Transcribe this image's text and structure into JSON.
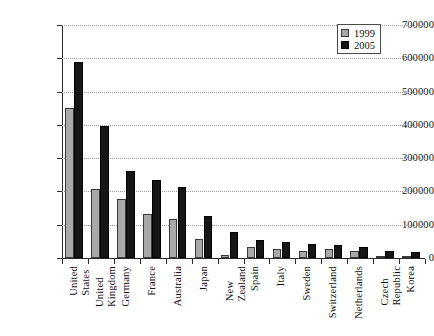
{
  "chart_data": {
    "type": "bar",
    "title": "",
    "subtitle": "",
    "xlabel": "",
    "ylabel": "",
    "ylim": [
      0,
      700000
    ],
    "ytick_step": 100000,
    "yticks": [
      "0",
      "100000",
      "200000",
      "300000",
      "400000",
      "500000",
      "600000",
      "700000"
    ],
    "grid": true,
    "legend_position": "top-right",
    "categories": [
      "United States",
      "United Kingdom",
      "Germany",
      "France",
      "Australia",
      "Japan",
      "New Zealand",
      "Spain",
      "Italy",
      "Sweden",
      "Switzerland",
      "Netherlands",
      "Czech Republic",
      "Korea"
    ],
    "category_labels_wrapped": [
      "United\nStates",
      "United\nKingdom",
      "Germany",
      "France",
      "Australia",
      "Japan",
      "New\nZealand",
      "Spain",
      "Italy",
      "Sweden",
      "Switzerland",
      "Netherlands",
      "Czech\nRepublic",
      "Korea"
    ],
    "series": [
      {
        "name": "1999",
        "color": "#a9a9a9",
        "values": [
          450000,
          208000,
          178000,
          132000,
          117000,
          58000,
          8000,
          33000,
          26000,
          22000,
          27000,
          21000,
          4000,
          1000
        ]
      },
      {
        "name": "2005",
        "color": "#161616",
        "values": [
          590000,
          396000,
          260000,
          235000,
          213000,
          125000,
          78000,
          53000,
          48000,
          42000,
          39000,
          33000,
          22000,
          18000
        ]
      }
    ]
  },
  "legend": {
    "entries": [
      {
        "label": "1999"
      },
      {
        "label": "2005"
      }
    ]
  }
}
